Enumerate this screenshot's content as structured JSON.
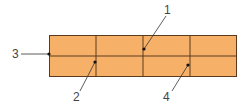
{
  "diagram": {
    "grid": {
      "rows": 2,
      "columns": 4,
      "fill_color": "#F6B068",
      "line_color": "#5A3A1E"
    },
    "callouts": [
      {
        "id": "1",
        "label": "1",
        "target": "intersection of row divider and second column divider (top cell corner)"
      },
      {
        "id": "2",
        "label": "2",
        "target": "intersection of row divider and first column divider"
      },
      {
        "id": "3",
        "label": "3",
        "target": "left edge at row divider"
      },
      {
        "id": "4",
        "label": "4",
        "target": "intersection of row divider and third column divider"
      }
    ],
    "leader_color": "#333333",
    "label_color": "#444444"
  }
}
